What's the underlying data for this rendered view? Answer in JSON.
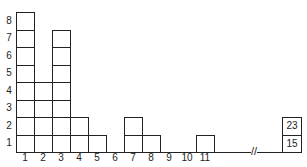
{
  "chart_data": {
    "type": "bar",
    "title": "",
    "xlabel": "",
    "ylabel": "",
    "categories": [
      "1",
      "2",
      "3",
      "4",
      "5",
      "6",
      "7",
      "8",
      "9",
      "10",
      "11"
    ],
    "values": [
      8,
      4,
      7,
      2,
      1,
      0,
      2,
      1,
      0,
      0,
      1
    ],
    "outliers": [
      15,
      23
    ],
    "outlier_stack": [
      "23",
      "15"
    ],
    "yticks": [
      "1",
      "2",
      "3",
      "4",
      "5",
      "6",
      "7",
      "8"
    ],
    "ylim": [
      0,
      8
    ],
    "axis_break": "//",
    "grid": false,
    "style": "stacked unit squares"
  }
}
